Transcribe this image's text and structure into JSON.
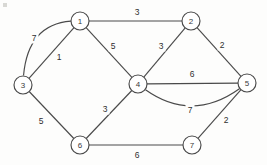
{
  "diagram": {
    "type": "graph",
    "stroke_color": "#4a4a4a",
    "background_color": "#fdfdfc",
    "node_fill": "#ffffff",
    "node_radius": 9,
    "nodes": [
      {
        "id": "1",
        "label": "1",
        "x": 80,
        "y": 21
      },
      {
        "id": "2",
        "label": "2",
        "x": 191,
        "y": 21
      },
      {
        "id": "3",
        "label": "3",
        "x": 23,
        "y": 85
      },
      {
        "id": "4",
        "label": "4",
        "x": 138,
        "y": 84
      },
      {
        "id": "5",
        "label": "5",
        "x": 247,
        "y": 83
      },
      {
        "id": "6",
        "label": "6",
        "x": 80,
        "y": 145
      },
      {
        "id": "7",
        "label": "7",
        "x": 192,
        "y": 145
      }
    ],
    "edges": [
      {
        "from": "1",
        "to": "2",
        "weight": "3",
        "shape": "straight",
        "label_x": 137,
        "label_y": 12
      },
      {
        "from": "1",
        "to": "3",
        "weight": "7",
        "shape": "curved",
        "curve_x": 38,
        "curve_y": 36,
        "label_x": 34,
        "label_y": 38
      },
      {
        "from": "1",
        "to": "3",
        "weight": "1",
        "shape": "straight",
        "label_x": 59,
        "label_y": 57
      },
      {
        "from": "1",
        "to": "4",
        "weight": "5",
        "shape": "straight",
        "label_x": 113,
        "label_y": 46
      },
      {
        "from": "2",
        "to": "4",
        "weight": "3",
        "shape": "straight",
        "label_x": 161,
        "label_y": 46
      },
      {
        "from": "2",
        "to": "5",
        "weight": "2",
        "shape": "straight",
        "label_x": 222,
        "label_y": 45
      },
      {
        "from": "3",
        "to": "6",
        "weight": "5",
        "shape": "straight",
        "label_x": 41,
        "label_y": 121
      },
      {
        "from": "4",
        "to": "5",
        "weight": "6",
        "shape": "straight",
        "label_x": 192,
        "label_y": 74
      },
      {
        "from": "4",
        "to": "5",
        "weight": "7",
        "shape": "curved",
        "curve_x": 192,
        "curve_y": 106,
        "label_x": 190,
        "label_y": 110
      },
      {
        "from": "4",
        "to": "6",
        "weight": "3",
        "shape": "straight",
        "label_x": 105,
        "label_y": 109
      },
      {
        "from": "5",
        "to": "7",
        "weight": "2",
        "shape": "straight",
        "label_x": 226,
        "label_y": 120
      },
      {
        "from": "6",
        "to": "7",
        "weight": "6",
        "shape": "straight",
        "label_x": 137,
        "label_y": 155
      }
    ]
  }
}
